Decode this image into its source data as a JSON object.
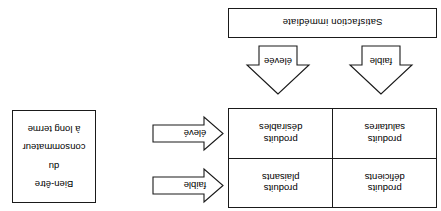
{
  "figure": {
    "orientation": "rotated-180",
    "language": "fr",
    "line_color": "#1a1a1a",
    "background": "#ffffff"
  },
  "matrix": {
    "cells": [
      {
        "line1": "produits",
        "line2": "déficients"
      },
      {
        "line1": "produits",
        "line2": "plaisants"
      },
      {
        "line1": "produits",
        "line2": "salutaires"
      },
      {
        "line1": "produits",
        "line2": "désirables"
      }
    ]
  },
  "vertical_axis": {
    "title_line1": "Bien-être",
    "title_line2": "du",
    "title_line3": "consommateur",
    "title_line4": "à long terme",
    "arrows": [
      {
        "label": "faible",
        "direction": "right"
      },
      {
        "label": "élevé",
        "direction": "right"
      }
    ]
  },
  "horizontal_axis": {
    "title": "Satisfaction immédiate",
    "arrows": [
      {
        "label": "faible",
        "direction": "up"
      },
      {
        "label": "élevée",
        "direction": "up"
      }
    ]
  }
}
